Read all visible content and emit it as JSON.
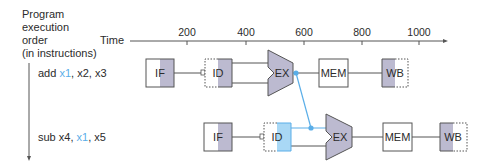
{
  "y_axis_label": [
    "Program",
    "execution",
    "order",
    "(in instructions)"
  ],
  "time_label": "Time",
  "ticks": [
    "200",
    "400",
    "600",
    "800",
    "1000"
  ],
  "colors": {
    "stage_fill": "#bcbad0",
    "highlight": "#5aaee8",
    "highlight_fill": "#a9d8f5",
    "line": "#555555"
  },
  "instructions": [
    {
      "pre": "add ",
      "reg_highlight": "x1",
      "post": ", x2, x3",
      "stages": [
        "IF",
        "ID",
        "EX",
        "MEM",
        "WB"
      ]
    },
    {
      "pre": "sub x4, ",
      "reg_highlight": "x1",
      "post": ", x5",
      "stages": [
        "IF",
        "ID",
        "EX",
        "MEM",
        "WB"
      ]
    }
  ]
}
